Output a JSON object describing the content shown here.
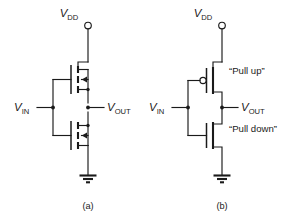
{
  "figure": {
    "background_color": "#ffffff",
    "line_color": "#1a1a1a"
  },
  "circuits": [
    {
      "id": "circuit-a",
      "caption": "(a)",
      "description": "CMOS inverter drawn with full four-terminal MOSFET symbols",
      "supply_label_main": "V",
      "supply_label_sub": "DD",
      "input_label_main": "V",
      "input_label_sub": "IN",
      "output_label_main": "V",
      "output_label_sub": "OUT",
      "devices": [
        {
          "name": "pmos",
          "symbol": "mosfet-full",
          "arrow": "inward"
        },
        {
          "name": "nmos",
          "symbol": "mosfet-full",
          "arrow": "inward"
        }
      ],
      "ground": "earth-ground"
    },
    {
      "id": "circuit-b",
      "caption": "(b)",
      "description": "CMOS inverter drawn with simplified switch symbols",
      "supply_label_main": "V",
      "supply_label_sub": "DD",
      "input_label_main": "V",
      "input_label_sub": "IN",
      "output_label_main": "V",
      "output_label_sub": "OUT",
      "pullup_label": "“Pull up”",
      "pulldown_label": "“Pull down”",
      "devices": [
        {
          "name": "pmos",
          "symbol": "mosfet-simple",
          "bubble": true
        },
        {
          "name": "nmos",
          "symbol": "mosfet-simple",
          "bubble": false
        }
      ],
      "ground": "earth-ground"
    }
  ]
}
